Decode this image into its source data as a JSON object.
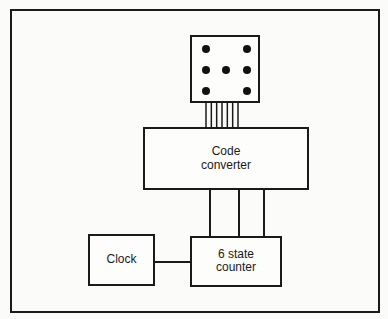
{
  "diagram": {
    "frame": {
      "x": 11,
      "y": 10,
      "w": 368,
      "h": 302
    },
    "die": {
      "label": "Die display (six-pip face)",
      "x": 191,
      "y": 36,
      "w": 68,
      "h": 66,
      "pips": [
        {
          "cx": 206,
          "cy": 49
        },
        {
          "cx": 247,
          "cy": 49
        },
        {
          "cx": 206,
          "cy": 70
        },
        {
          "cx": 226,
          "cy": 70
        },
        {
          "cx": 247,
          "cy": 70
        },
        {
          "cx": 206,
          "cy": 91
        },
        {
          "cx": 247,
          "cy": 91
        }
      ],
      "pip_radius": 4
    },
    "die_bus": {
      "line_count": 7,
      "x_start": 206,
      "x_end": 238,
      "y1": 102,
      "y2": 128
    },
    "code_converter": {
      "lines": [
        "Code",
        "converter"
      ],
      "x": 144,
      "y": 128,
      "w": 164,
      "h": 61
    },
    "counter_bus": {
      "xs": [
        210,
        239,
        264
      ],
      "y1": 189,
      "y2": 237
    },
    "clock": {
      "lines": [
        "Clock"
      ],
      "x": 89,
      "y": 235,
      "w": 65,
      "h": 50
    },
    "counter": {
      "lines": [
        "6 state",
        "counter"
      ],
      "x": 191,
      "y": 237,
      "w": 90,
      "h": 49
    },
    "clock_link": {
      "x1": 154,
      "x2": 191,
      "y": 262
    },
    "colors": {
      "ink": "#1a1a1a",
      "paper": "#fbfbf9"
    }
  }
}
